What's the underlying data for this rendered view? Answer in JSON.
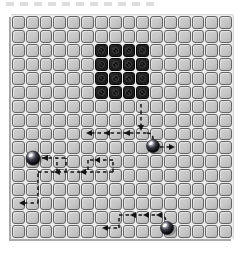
{
  "figure": {
    "colors": {
      "background": "#ffffff",
      "tile_fill": "#c6c6c6",
      "tile_border": "#646464",
      "gap": "#ededed",
      "edge_shadow": "#a9a9a9",
      "block_fill": "#1c1c1c",
      "block_border": "#050505",
      "block_mark": "#3f3f3f",
      "path": "#141414",
      "sphere_body": "#0a0a10",
      "sphere_highlight": "#ffffff"
    },
    "grid": {
      "cols": 16,
      "rows": 16,
      "x": 11,
      "y": 15,
      "width": 222,
      "height": 224,
      "block": {
        "col": 6,
        "row": 2,
        "cols": 4,
        "rows": 4
      }
    },
    "path_style": {
      "dash": "3.5 3",
      "width": 1.5
    },
    "trails": [
      {
        "d": "M141,104 L141,126"
      },
      {
        "d": "M91,133 L147,133"
      },
      {
        "d": "M147,133 Q153,133 153,139"
      },
      {
        "d": "M160,147 L169,147"
      },
      {
        "d": "M24,203 L38,203"
      },
      {
        "d": "M38,203 L38,172"
      },
      {
        "d": "M38,172 L113,172"
      },
      {
        "d": "M113,172 L113,160"
      },
      {
        "d": "M113,160 L88,160"
      },
      {
        "d": "M88,160 L88,172"
      },
      {
        "d": "M57,172 L57,158"
      },
      {
        "d": "M66,172 L66,158"
      },
      {
        "d": "M42,158 L66,158"
      },
      {
        "d": "M107,228 L119,228"
      },
      {
        "d": "M119,228 L119,215"
      },
      {
        "d": "M119,215 L158,215"
      },
      {
        "d": "M158,215 Q166,215 166,222"
      }
    ],
    "arrows": [
      {
        "x": 141,
        "y": 131,
        "dir": "down"
      },
      {
        "x": 86,
        "y": 133,
        "dir": "left"
      },
      {
        "x": 104,
        "y": 133,
        "dir": "left"
      },
      {
        "x": 124,
        "y": 133,
        "dir": "left"
      },
      {
        "x": 175,
        "y": 147,
        "dir": "right"
      },
      {
        "x": 19,
        "y": 203,
        "dir": "left"
      },
      {
        "x": 54,
        "y": 172,
        "dir": "left"
      },
      {
        "x": 80,
        "y": 172,
        "dir": "left"
      },
      {
        "x": 94,
        "y": 160,
        "dir": "left"
      },
      {
        "x": 42,
        "y": 158,
        "dir": "left"
      },
      {
        "x": 102,
        "y": 228,
        "dir": "left"
      },
      {
        "x": 130,
        "y": 215,
        "dir": "left"
      },
      {
        "x": 143,
        "y": 215,
        "dir": "left"
      },
      {
        "x": 156,
        "y": 215,
        "dir": "left"
      }
    ],
    "robots": [
      {
        "name": "robot-upper",
        "cx": 153,
        "cy": 146,
        "r": 6.5
      },
      {
        "name": "robot-left",
        "cx": 33,
        "cy": 158,
        "r": 7
      },
      {
        "name": "robot-lower",
        "cx": 167,
        "cy": 228,
        "r": 6.5
      }
    ]
  }
}
